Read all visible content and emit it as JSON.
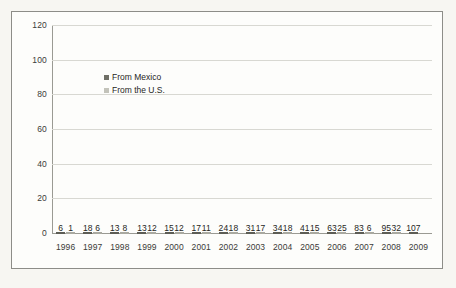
{
  "chart_data": {
    "type": "bar",
    "title": "",
    "xlabel": "",
    "ylabel": "",
    "ylim": [
      0,
      120
    ],
    "yticks": [
      0,
      20,
      40,
      60,
      80,
      100,
      120
    ],
    "grid": true,
    "legend_position": "inside-upper-left",
    "categories": [
      "1996",
      "1997",
      "1998",
      "1999",
      "2000",
      "2001",
      "2002",
      "2003",
      "2004",
      "2005",
      "2006",
      "2007",
      "2008",
      "2009"
    ],
    "series": [
      {
        "name": "From Mexico",
        "color": "#6f6f66",
        "values": [
          6,
          18,
          13,
          13,
          15,
          17,
          24,
          31,
          34,
          41,
          63,
          83,
          95,
          107
        ]
      },
      {
        "name": "From the U.S.",
        "color": "#c3c3ba",
        "values": [
          1,
          6,
          8,
          12,
          12,
          11,
          18,
          17,
          18,
          15,
          25,
          6,
          32,
          null
        ]
      }
    ]
  },
  "legend": {
    "items": [
      {
        "label": "From Mexico"
      },
      {
        "label": "From the U.S."
      }
    ]
  },
  "colors": {
    "mexico": "#6f6f66",
    "us": "#c3c3ba",
    "axis": "#9a9a93",
    "grid": "#d8d8d2",
    "frame": "#8d8d88",
    "text": "#262623",
    "plot_background": "#fdfdfb",
    "page_background": "#f7f6f2"
  }
}
